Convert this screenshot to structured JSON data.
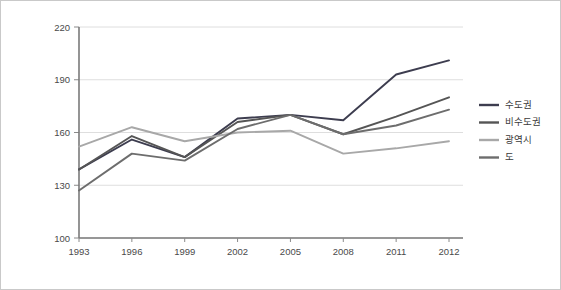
{
  "chart_data": {
    "type": "line",
    "title": "",
    "xlabel": "",
    "ylabel": "",
    "categories": [
      "1993",
      "1996",
      "1999",
      "2002",
      "2005",
      "2008",
      "2011",
      "2012"
    ],
    "x_tick_labels": [
      "1993",
      "1996",
      "1999",
      "2002",
      "2005",
      "2008",
      "2011",
      "2012"
    ],
    "y_tick_labels": [
      "100",
      "130",
      "160",
      "190",
      "220"
    ],
    "y_ticks": [
      100,
      130,
      160,
      190,
      220
    ],
    "ylim": [
      100,
      220
    ],
    "grid": true,
    "legend_position": "right",
    "series": [
      {
        "name": "수도권",
        "color": "#3d3d4f",
        "values": [
          139,
          156,
          146,
          168,
          170,
          167,
          193,
          201
        ]
      },
      {
        "name": "비수도권",
        "color": "#555555",
        "values": [
          139,
          158,
          146,
          166,
          170,
          159,
          169,
          180
        ]
      },
      {
        "name": "광역시",
        "color": "#a8a8a8",
        "values": [
          152,
          163,
          155,
          160,
          161,
          148,
          151,
          155
        ]
      },
      {
        "name": "도",
        "color": "#6d6d6d",
        "values": [
          127,
          148,
          144,
          162,
          170,
          159,
          164,
          173
        ]
      }
    ]
  },
  "legend": {
    "items": [
      {
        "label": "수도권",
        "color": "#3d3d4f"
      },
      {
        "label": "비수도권",
        "color": "#555555"
      },
      {
        "label": "광역시",
        "color": "#a8a8a8"
      },
      {
        "label": "도",
        "color": "#6d6d6d"
      }
    ]
  }
}
